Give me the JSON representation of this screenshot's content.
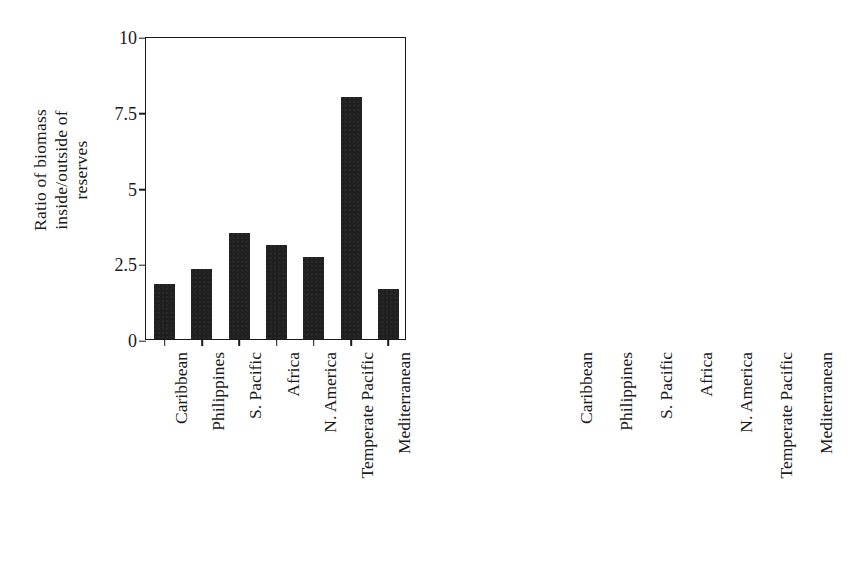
{
  "figure": {
    "background_color": "#ffffff",
    "bar_color": "#201f1f",
    "axis_color": "#1a1a1a"
  },
  "chart_data": [
    {
      "type": "bar",
      "panel": "left",
      "title": "",
      "xlabel": "",
      "ylabel": "Ratio of biomass\ninside/outside of\nreserves",
      "ylabel_lines": [
        "Ratio of biomass",
        "inside/outside of",
        "reserves"
      ],
      "categories": [
        "Caribbean",
        "Philippines",
        "S. Pacific",
        "Africa",
        "N. America",
        "Temperate Pacific",
        "Mediterranean"
      ],
      "values": [
        1.8,
        2.3,
        3.5,
        3.1,
        2.7,
        8.0,
        1.65
      ],
      "ylim": [
        0,
        10
      ],
      "yticks": [
        0,
        2.5,
        5,
        7.5,
        10
      ],
      "ytick_labels": [
        "0",
        "2.5",
        "5",
        "7.5",
        "10"
      ],
      "grid": false,
      "legend": false
    },
    {
      "type": "bar",
      "panel": "right",
      "title": "",
      "xlabel": "",
      "ylabel": "Percent increase in density",
      "ylabel_lines": [
        "Percent increase in density"
      ],
      "categories": [
        "Caribbean",
        "Philippines",
        "S. Pacific",
        "Africa",
        "N. America",
        "Temperate Pacific",
        "Mediterranean"
      ],
      "values": [
        75,
        80,
        150,
        140,
        69,
        20,
        34
      ],
      "ylim": [
        0,
        200
      ],
      "yticks": [
        0,
        50,
        100,
        150,
        200
      ],
      "ytick_labels": [
        "0",
        "50",
        "100",
        "150",
        "200"
      ],
      "grid": false,
      "legend": false
    }
  ]
}
